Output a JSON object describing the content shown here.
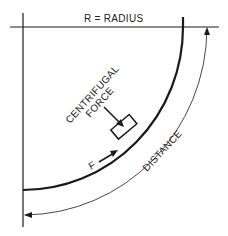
{
  "diagram": {
    "labels": {
      "radius": "R = RADIUS",
      "centrifugal_line1": "CENTRIFUGAL",
      "centrifugal_line2": "FORCE",
      "force": "F",
      "distance": "DISTANCE"
    },
    "colors": {
      "ink": "#1a1a1a",
      "background": "#ffffff"
    }
  }
}
